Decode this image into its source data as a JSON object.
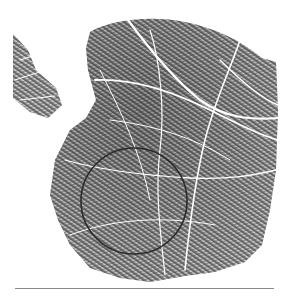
{
  "figure": {
    "annotation": "circle marking region of interest",
    "circle": {
      "cx": 134,
      "cy": 201,
      "r": 53,
      "stroke": "#2a2a2a"
    },
    "colors": {
      "background": "#ffffff",
      "ink_dark": "#3a3a3a",
      "ink_mid": "#7a7a7a",
      "crease": "#ffffff",
      "rule": "#8a8a8a"
    }
  }
}
